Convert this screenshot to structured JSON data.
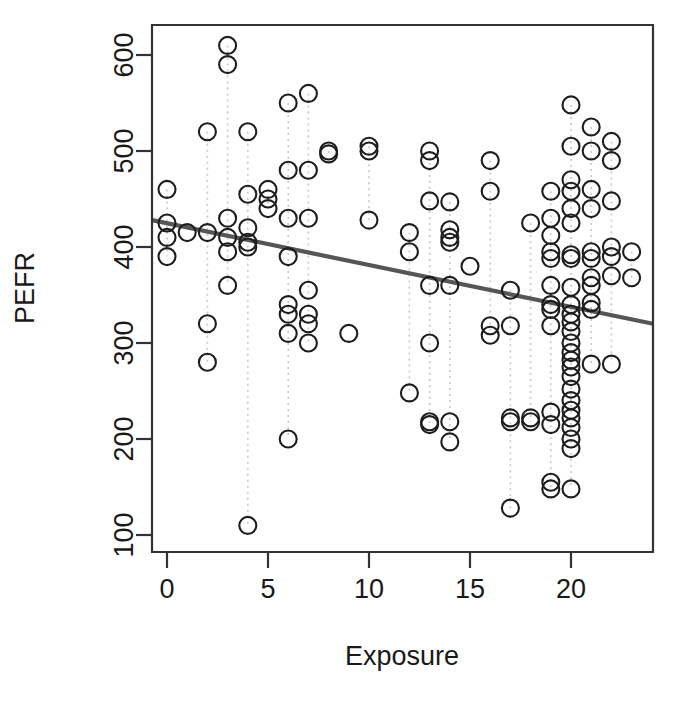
{
  "chart_data": {
    "type": "scatter",
    "title": "",
    "xlabel": "Exposure",
    "ylabel": "PEFR",
    "xlim": [
      -0.8,
      24.0
    ],
    "ylim": [
      70,
      640
    ],
    "grid": false,
    "legend": null,
    "x_ticks": [
      0,
      5,
      10,
      15,
      20
    ],
    "y_ticks": [
      100,
      200,
      300,
      400,
      500,
      600
    ],
    "marker": "open-circle",
    "marker_color": "#1d1d1d",
    "connector_color": "#c9c9c9",
    "connector_style": "dotted-vertical",
    "fit_line": {
      "type": "linear-regression",
      "color": "#565656",
      "x_start": -0.8,
      "y_start": 428,
      "x_end": 24.0,
      "y_end": 320,
      "slope": -4.35,
      "intercept": 424.5
    },
    "points": [
      [
        0,
        460
      ],
      [
        0,
        425
      ],
      [
        0,
        410
      ],
      [
        0,
        390
      ],
      [
        1,
        415
      ],
      [
        2,
        520
      ],
      [
        2,
        415
      ],
      [
        2,
        320
      ],
      [
        2,
        280
      ],
      [
        3,
        610
      ],
      [
        3,
        590
      ],
      [
        3,
        430
      ],
      [
        3,
        410
      ],
      [
        3,
        395
      ],
      [
        3,
        360
      ],
      [
        4,
        520
      ],
      [
        4,
        455
      ],
      [
        4,
        420
      ],
      [
        4,
        405
      ],
      [
        4,
        400
      ],
      [
        4,
        110
      ],
      [
        5,
        460
      ],
      [
        5,
        450
      ],
      [
        5,
        440
      ],
      [
        6,
        550
      ],
      [
        6,
        480
      ],
      [
        6,
        430
      ],
      [
        6,
        390
      ],
      [
        6,
        340
      ],
      [
        6,
        330
      ],
      [
        6,
        310
      ],
      [
        6,
        200
      ],
      [
        7,
        560
      ],
      [
        7,
        480
      ],
      [
        7,
        430
      ],
      [
        7,
        355
      ],
      [
        7,
        330
      ],
      [
        7,
        320
      ],
      [
        7,
        300
      ],
      [
        8,
        500
      ],
      [
        8,
        497
      ],
      [
        9,
        310
      ],
      [
        10,
        505
      ],
      [
        10,
        500
      ],
      [
        10,
        428
      ],
      [
        12,
        415
      ],
      [
        12,
        395
      ],
      [
        12,
        248
      ],
      [
        13,
        500
      ],
      [
        13,
        490
      ],
      [
        13,
        448
      ],
      [
        13,
        360
      ],
      [
        13,
        300
      ],
      [
        13,
        218
      ],
      [
        13,
        215
      ],
      [
        14,
        447
      ],
      [
        14,
        418
      ],
      [
        14,
        410
      ],
      [
        14,
        405
      ],
      [
        14,
        360
      ],
      [
        14,
        218
      ],
      [
        14,
        197
      ],
      [
        15,
        380
      ],
      [
        16,
        490
      ],
      [
        16,
        458
      ],
      [
        16,
        318
      ],
      [
        16,
        308
      ],
      [
        17,
        355
      ],
      [
        17,
        318
      ],
      [
        17,
        222
      ],
      [
        17,
        218
      ],
      [
        17,
        128
      ],
      [
        18,
        425
      ],
      [
        18,
        222
      ],
      [
        18,
        218
      ],
      [
        19,
        458
      ],
      [
        19,
        430
      ],
      [
        19,
        412
      ],
      [
        19,
        395
      ],
      [
        19,
        388
      ],
      [
        19,
        360
      ],
      [
        19,
        340
      ],
      [
        19,
        335
      ],
      [
        19,
        318
      ],
      [
        19,
        228
      ],
      [
        19,
        215
      ],
      [
        19,
        155
      ],
      [
        19,
        148
      ],
      [
        20,
        548
      ],
      [
        20,
        505
      ],
      [
        20,
        470
      ],
      [
        20,
        458
      ],
      [
        20,
        440
      ],
      [
        20,
        425
      ],
      [
        20,
        392
      ],
      [
        20,
        388
      ],
      [
        20,
        358
      ],
      [
        20,
        340
      ],
      [
        20,
        330
      ],
      [
        20,
        322
      ],
      [
        20,
        312
      ],
      [
        20,
        300
      ],
      [
        20,
        290
      ],
      [
        20,
        282
      ],
      [
        20,
        275
      ],
      [
        20,
        265
      ],
      [
        20,
        252
      ],
      [
        20,
        240
      ],
      [
        20,
        230
      ],
      [
        20,
        222
      ],
      [
        20,
        212
      ],
      [
        20,
        200
      ],
      [
        20,
        190
      ],
      [
        20,
        148
      ],
      [
        21,
        525
      ],
      [
        21,
        500
      ],
      [
        21,
        460
      ],
      [
        21,
        440
      ],
      [
        21,
        395
      ],
      [
        21,
        388
      ],
      [
        21,
        368
      ],
      [
        21,
        360
      ],
      [
        21,
        342
      ],
      [
        21,
        335
      ],
      [
        21,
        278
      ],
      [
        22,
        510
      ],
      [
        22,
        490
      ],
      [
        22,
        448
      ],
      [
        22,
        400
      ],
      [
        22,
        390
      ],
      [
        22,
        370
      ],
      [
        22,
        278
      ],
      [
        23,
        395
      ],
      [
        23,
        368
      ]
    ],
    "connectors": [
      {
        "x": 0,
        "y_top": 460,
        "y_bottom": 390
      },
      {
        "x": 2,
        "y_top": 520,
        "y_bottom": 280
      },
      {
        "x": 3,
        "y_top": 610,
        "y_bottom": 360
      },
      {
        "x": 4,
        "y_top": 520,
        "y_bottom": 110
      },
      {
        "x": 5,
        "y_top": 460,
        "y_bottom": 440
      },
      {
        "x": 6,
        "y_top": 550,
        "y_bottom": 200
      },
      {
        "x": 7,
        "y_top": 560,
        "y_bottom": 300
      },
      {
        "x": 8,
        "y_top": 500,
        "y_bottom": 497
      },
      {
        "x": 10,
        "y_top": 505,
        "y_bottom": 428
      },
      {
        "x": 12,
        "y_top": 415,
        "y_bottom": 248
      },
      {
        "x": 13,
        "y_top": 500,
        "y_bottom": 215
      },
      {
        "x": 14,
        "y_top": 447,
        "y_bottom": 197
      },
      {
        "x": 16,
        "y_top": 490,
        "y_bottom": 308
      },
      {
        "x": 17,
        "y_top": 355,
        "y_bottom": 128
      },
      {
        "x": 18,
        "y_top": 425,
        "y_bottom": 218
      },
      {
        "x": 19,
        "y_top": 458,
        "y_bottom": 148
      },
      {
        "x": 20,
        "y_top": 548,
        "y_bottom": 148
      },
      {
        "x": 21,
        "y_top": 525,
        "y_bottom": 278
      },
      {
        "x": 22,
        "y_top": 510,
        "y_bottom": 278
      },
      {
        "x": 23,
        "y_top": 395,
        "y_bottom": 368
      }
    ]
  }
}
